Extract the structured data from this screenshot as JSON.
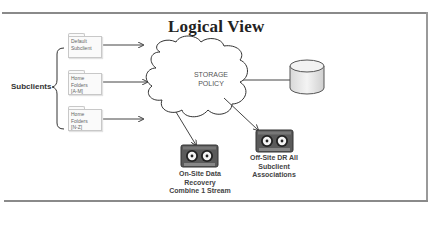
{
  "title": "Logical View",
  "subclients": {
    "label": "Subclients",
    "items": [
      {
        "label": "Default\nSubclient"
      },
      {
        "label": "Home\nFolders\n[A-M]"
      },
      {
        "label": "Home\nFolders\n[N-Z]"
      }
    ]
  },
  "storage_policy": {
    "label": "STORAGE\nPOLICY"
  },
  "targets": {
    "disk": {
      "icon": "database-cylinder-icon"
    },
    "onsite": {
      "label": "On-Site Data\nRecovery\nCombine 1 Stream",
      "icon": "tape-icon"
    },
    "offsite": {
      "label": "Off-Site DR All\nSubclient\nAssociations",
      "icon": "tape-icon"
    }
  },
  "colors": {
    "frame": "#8a8a8a",
    "lines": "#444444",
    "tape_body": "#5a5a5a"
  }
}
